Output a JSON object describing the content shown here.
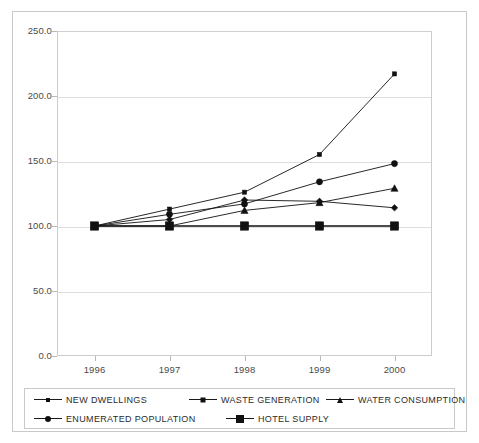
{
  "chart_data": {
    "type": "line",
    "title": "",
    "subtitle": "",
    "xlabel": "",
    "ylabel": "",
    "categories": [
      "1996",
      "1997",
      "1998",
      "1999",
      "2000"
    ],
    "x": [
      1996,
      1997,
      1998,
      1999,
      2000
    ],
    "ylim": [
      0.0,
      250.0
    ],
    "ytick_labels": [
      "0.0",
      "50.0",
      "100.0",
      "150.0",
      "200.0",
      "250.0"
    ],
    "ytick_values": [
      0,
      50,
      100,
      150,
      200,
      250
    ],
    "grid": true,
    "legend_position": "bottom",
    "series": [
      {
        "name": "NEW DWELLINGS",
        "marker": "small-square",
        "color": "#111111",
        "values": [
          100,
          113,
          126,
          155,
          217
        ]
      },
      {
        "name": "WASTE GENERATION",
        "marker": "diamond",
        "color": "#111111",
        "values": [
          100,
          105,
          120,
          119,
          114
        ]
      },
      {
        "name": "WATER CONSUMPTION",
        "marker": "triangle",
        "color": "#111111",
        "values": [
          100,
          100,
          112,
          118,
          129
        ]
      },
      {
        "name": "ENUMERATED POPULATION",
        "marker": "circle",
        "color": "#111111",
        "values": [
          100,
          109,
          117,
          134,
          148
        ]
      },
      {
        "name": "HOTEL SUPPLY",
        "marker": "large-square",
        "color": "#111111",
        "values": [
          100,
          100,
          100,
          100,
          100
        ]
      }
    ]
  },
  "legend": {
    "rows": [
      [
        {
          "label": "NEW DWELLINGS",
          "marker": "small-square"
        },
        {
          "label": "WASTE GENERATION",
          "marker": "diamond"
        },
        {
          "label": "WATER CONSUMPTION",
          "marker": "triangle"
        }
      ],
      [
        {
          "label": "ENUMERATED POPULATION",
          "marker": "circle"
        },
        {
          "label": "HOTEL SUPPLY",
          "marker": "large-square"
        }
      ]
    ]
  }
}
